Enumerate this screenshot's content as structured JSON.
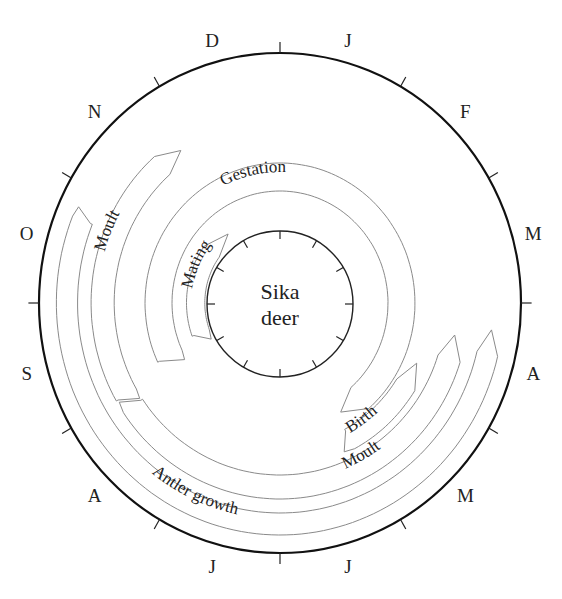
{
  "diagram": {
    "center": {
      "x": 280,
      "y": 303
    },
    "center_label": [
      "Sika",
      "deer"
    ],
    "outer_ring": {
      "rx": 241,
      "ry": 250
    },
    "inner_ring": {
      "r": 73
    },
    "months": [
      {
        "label": "J",
        "angle": 15
      },
      {
        "label": "F",
        "angle": 45
      },
      {
        "label": "M",
        "angle": 75
      },
      {
        "label": "A",
        "angle": 105
      },
      {
        "label": "M",
        "angle": 135
      },
      {
        "label": "J",
        "angle": 165
      },
      {
        "label": "J",
        "angle": 195
      },
      {
        "label": "A",
        "angle": 225
      },
      {
        "label": "S",
        "angle": 255
      },
      {
        "label": "O",
        "angle": 285
      },
      {
        "label": "N",
        "angle": 315
      },
      {
        "label": "D",
        "angle": 345
      }
    ],
    "bands": [
      {
        "id": "antler-growth",
        "label": "Antler growth",
        "r_in": 210,
        "r_out": 232,
        "start": 97,
        "end": 292,
        "arrow_at": "start",
        "label_angle": 205,
        "label_r": 221,
        "label_flip": true
      },
      {
        "id": "moult-autumn",
        "label": "Moult",
        "r_in": 172,
        "r_out": 196,
        "start": 240,
        "end": 326,
        "arrow_at": "end",
        "label_angle": 292,
        "label_r": 184,
        "label_flip": false
      },
      {
        "id": "moult-spring",
        "label": "Moult",
        "r_in": 172,
        "r_out": 196,
        "start": 100,
        "end": 236,
        "arrow_at": "start",
        "label_angle": 151,
        "label_r": 184,
        "label_flip": true
      },
      {
        "id": "birth",
        "label": "Birth",
        "r_in": 143,
        "r_out": 165,
        "start": 113,
        "end": 152,
        "arrow_at": "start",
        "label_angle": 144,
        "label_r": 154,
        "label_flip": true
      },
      {
        "id": "gestation",
        "label": "Gestation",
        "r_in": 112,
        "r_out": 140,
        "start": 245,
        "end": 510,
        "arrow_at": "end",
        "label_angle": 348,
        "label_r": 126,
        "label_flip": false
      },
      {
        "id": "mating",
        "label": "Mating",
        "r_in": 78,
        "r_out": 97,
        "start": 250,
        "end": 322,
        "arrow_at": "end",
        "label_angle": 294,
        "label_r": 87,
        "label_flip": false
      }
    ]
  }
}
